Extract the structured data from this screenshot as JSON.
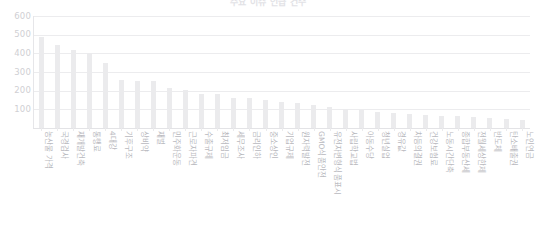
{
  "chart_data": {
    "type": "bar",
    "title": "주요 이슈 언급 건수",
    "xlabel": "",
    "ylabel": "",
    "ylim": [
      0,
      600
    ],
    "yticks": [
      600,
      500,
      400,
      300,
      200,
      100
    ],
    "grid": true,
    "legend": false,
    "orientation": "vertical",
    "bar_color": "#ebebed",
    "categories": [
      "농산물 가격",
      "국경검사",
      "재개발건축",
      "통행료",
      "4대강",
      "기후구조",
      "상비약",
      "재벌",
      "민주화운동",
      "근로자파견",
      "수출규제",
      "최저임금",
      "세무조사",
      "금리인하",
      "중소상인",
      "기업규제",
      "원자력발전",
      "GMO식품안전",
      "유전자변형식품표시",
      "사립학교법",
      "아동수당",
      "청년실업",
      "경유값",
      "차등의결권",
      "건강보험료",
      "노동시간단축",
      "종합부동산세",
      "전월세상한제",
      "반도체",
      "탄소배출권",
      "노인연금"
    ],
    "values": [
      490,
      443,
      420,
      400,
      351,
      255,
      252,
      252,
      213,
      206,
      180,
      180,
      163,
      160,
      150,
      142,
      134,
      126,
      112,
      100,
      95,
      88,
      82,
      76,
      71,
      66,
      62,
      57,
      52,
      47,
      42
    ]
  }
}
